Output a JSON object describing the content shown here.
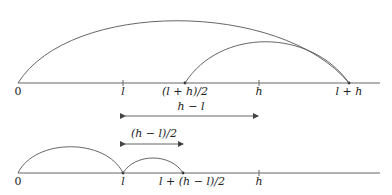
{
  "diagram": {
    "top_line": {
      "labels": {
        "zero": "0",
        "l": "l",
        "mid": "(l + h)/2",
        "h": "h",
        "lph": "l + h"
      }
    },
    "arrows": {
      "h_minus_l": "h − l",
      "half_h_minus_l": "(h − l)/2"
    },
    "bottom_line": {
      "labels": {
        "zero": "0",
        "l": "l",
        "mid": "l + (h − l)/2",
        "h": "h"
      }
    },
    "colors": {
      "stroke": "#555555",
      "text": "#222222",
      "background": "#ffffff"
    }
  }
}
